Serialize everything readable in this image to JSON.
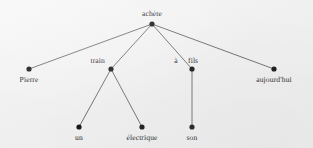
{
  "diagram": {
    "type": "dependency-tree",
    "language": "French",
    "sentence": "Pierre achète un train électrique à son fils aujourd'hui",
    "background_color": "#f0f0f0",
    "node_color": "#111111",
    "edge_color": "#4a4a4a",
    "text_color": "#16161a",
    "nodes": [
      {
        "id": "achete",
        "label": "achète",
        "x": 152,
        "y": 24,
        "label_x": 152,
        "label_y": 10,
        "align": "center"
      },
      {
        "id": "pierre",
        "label": "Pierre",
        "x": 29,
        "y": 69,
        "label_x": 29,
        "label_y": 76,
        "align": "center"
      },
      {
        "id": "train",
        "label": "train",
        "x": 111,
        "y": 69,
        "label_x": 105,
        "label_y": 57,
        "align": "right"
      },
      {
        "id": "fils",
        "label": "fils",
        "x": 192,
        "y": 69,
        "label_x": 188,
        "label_y": 57,
        "align": "left"
      },
      {
        "id": "aujourdhui",
        "label": "aujourd'hui",
        "x": 274,
        "y": 69,
        "label_x": 274,
        "label_y": 76,
        "align": "center"
      },
      {
        "id": "un",
        "label": "un",
        "x": 79,
        "y": 127,
        "label_x": 79,
        "label_y": 134,
        "align": "center"
      },
      {
        "id": "electrique",
        "label": "électrique",
        "x": 142,
        "y": 127,
        "label_x": 142,
        "label_y": 134,
        "align": "center"
      },
      {
        "id": "son",
        "label": "son",
        "x": 192,
        "y": 127,
        "label_x": 192,
        "label_y": 134,
        "align": "center"
      }
    ],
    "edge_labels": [
      {
        "id": "a",
        "label": "à",
        "x": 176,
        "y": 57,
        "align": "center"
      }
    ],
    "edges": [
      {
        "from": "achete",
        "to": "pierre"
      },
      {
        "from": "achete",
        "to": "train"
      },
      {
        "from": "achete",
        "to": "fils"
      },
      {
        "from": "achete",
        "to": "aujourdhui"
      },
      {
        "from": "train",
        "to": "un"
      },
      {
        "from": "train",
        "to": "electrique"
      },
      {
        "from": "fils",
        "to": "son"
      }
    ]
  }
}
